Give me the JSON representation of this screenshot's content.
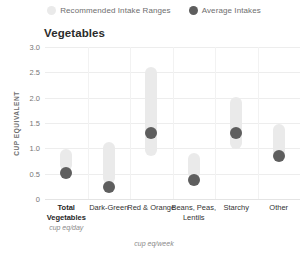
{
  "chart_data": {
    "type": "bar",
    "title": "Vegetables",
    "xlabel": "",
    "ylabel": "CUP EQUIVALENT",
    "ylim": [
      0,
      3.0
    ],
    "yticks": [
      "0",
      "0.5",
      "1.0",
      "1.5",
      "2.0",
      "2.5",
      "3.0"
    ],
    "ytick_values": [
      0,
      0.5,
      1.0,
      1.5,
      2.0,
      2.5,
      3.0
    ],
    "grid": true,
    "legend_position": "top-center",
    "legend": [
      {
        "label": "Recommended Intake Ranges",
        "color": "#eaeaea",
        "marker": "circle"
      },
      {
        "label": "Average Intakes",
        "color": "#5e5e5e",
        "marker": "circle"
      }
    ],
    "categories": [
      {
        "label": "Total Vegetables",
        "unit": "cup eq/day",
        "bold": true
      },
      {
        "label": "Dark-Green",
        "unit": "",
        "bold": false
      },
      {
        "label": "Red & Orange",
        "unit": "",
        "bold": false
      },
      {
        "label": "Beans, Peas, Lentils",
        "unit": "",
        "bold": false
      },
      {
        "label": "Starchy",
        "unit": "",
        "bold": false
      },
      {
        "label": "Other",
        "unit": "",
        "bold": false
      }
    ],
    "group_unit_label": "cup eq/week",
    "series": [
      {
        "name": "Recommended Intake Ranges",
        "type": "range",
        "ranges": [
          {
            "low": 0.55,
            "high": 0.98
          },
          {
            "low": 0.3,
            "high": 1.12
          },
          {
            "low": 0.85,
            "high": 2.6
          },
          {
            "low": 0.4,
            "high": 0.9
          },
          {
            "low": 0.98,
            "high": 2.02
          },
          {
            "low": 0.8,
            "high": 1.48
          }
        ]
      },
      {
        "name": "Average Intakes",
        "type": "point",
        "values": [
          0.52,
          0.24,
          1.3,
          0.38,
          1.3,
          0.85
        ]
      }
    ]
  }
}
